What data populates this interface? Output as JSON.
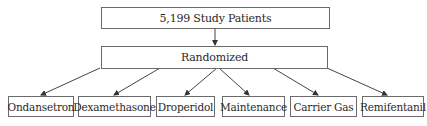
{
  "diagram": {
    "root": {
      "label": "5,199 Study Patients"
    },
    "middle": {
      "label": "Randomized"
    },
    "arms": [
      {
        "label": "Ondansetron"
      },
      {
        "label": "Dexamethasone"
      },
      {
        "label": "Droperidol"
      },
      {
        "label": "Maintenance"
      },
      {
        "label": "Carrier Gas"
      },
      {
        "label": "Remifentanil"
      }
    ],
    "colors": {
      "border": "#6a6a6a",
      "text": "#2a2a2a",
      "arrow": "#333333"
    }
  }
}
